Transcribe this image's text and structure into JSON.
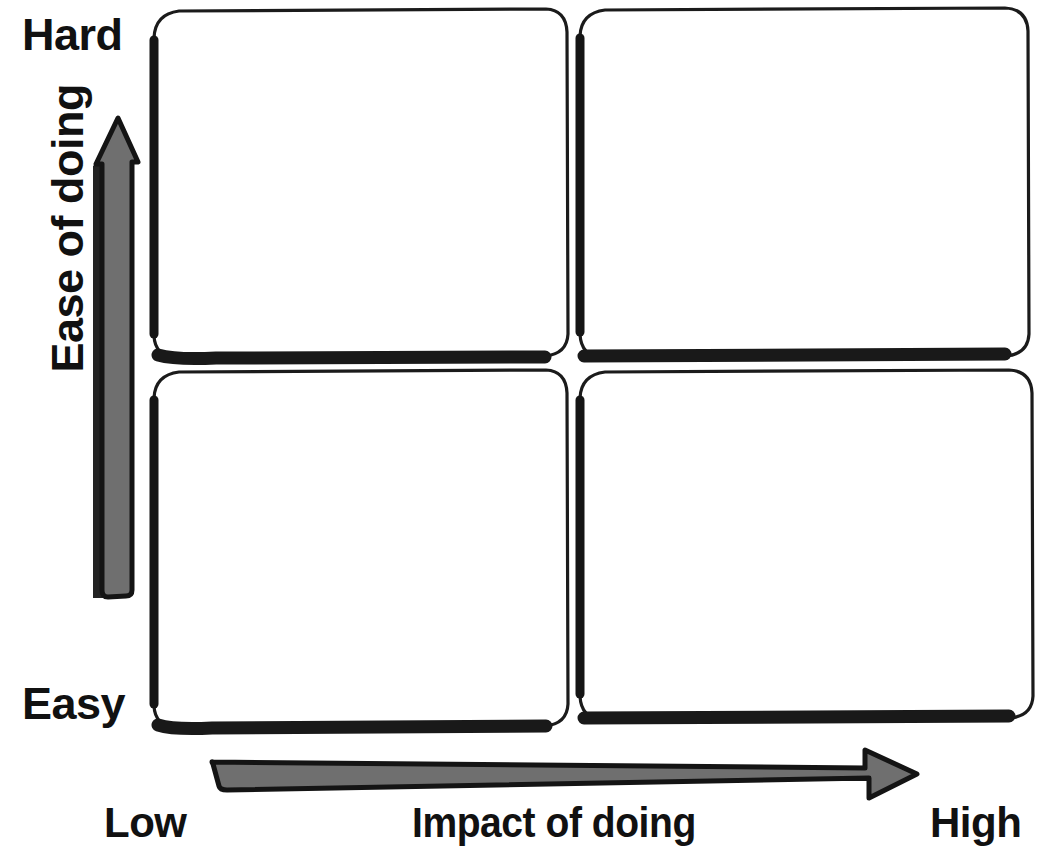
{
  "diagram": {
    "type": "2x2-matrix"
  },
  "axes": {
    "vertical": {
      "name": "Ease of doing",
      "low_end_label": "Easy",
      "high_end_label": "Hard",
      "arrow_direction": "up",
      "arrow_color": "#6f6f6f"
    },
    "horizontal": {
      "name": "Impact of doing",
      "low_end_label": "Low",
      "high_end_label": "High",
      "arrow_direction": "right",
      "arrow_color": "#6f6f6f"
    }
  },
  "quadrants": [
    {
      "id": "top-left",
      "label": "",
      "ease": "Hard",
      "impact": "Low"
    },
    {
      "id": "top-right",
      "label": "",
      "ease": "Hard",
      "impact": "High"
    },
    {
      "id": "bottom-left",
      "label": "",
      "ease": "Easy",
      "impact": "Low"
    },
    {
      "id": "bottom-right",
      "label": "",
      "ease": "Easy",
      "impact": "High"
    }
  ],
  "style": {
    "background": "#ffffff",
    "ink": "#111111",
    "box_border": "#1b1b1b"
  }
}
